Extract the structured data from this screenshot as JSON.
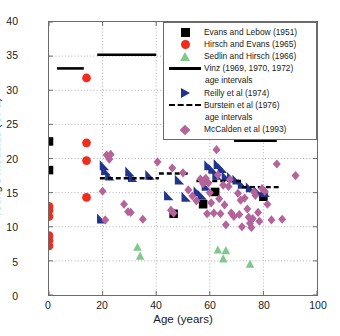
{
  "chart_data": {
    "type": "scatter",
    "title": "",
    "xlabel": "Age (years)",
    "ylabel": "Young's modulus (GPa)",
    "xlim": [
      0,
      100
    ],
    "ylim": [
      0,
      40
    ],
    "xticks": [
      0,
      20,
      40,
      60,
      80,
      100
    ],
    "yticks": [
      0,
      5,
      10,
      15,
      20,
      25,
      30,
      35,
      40
    ],
    "grid": "dotted",
    "legend_position": "top-right",
    "series": [
      {
        "name": "Evans and Lebow (1951)",
        "marker": "square",
        "color": "#000000",
        "points": [
          [
            0.0,
            22.5
          ],
          [
            0.0,
            18.3
          ],
          [
            46.5,
            11.9
          ],
          [
            57.5,
            13.3
          ],
          [
            62.0,
            15.1
          ],
          [
            80.0,
            14.4
          ]
        ]
      },
      {
        "name": "Hirsch and Evans (1965)",
        "marker": "circle",
        "color": "#f42b1c",
        "points": [
          [
            0.0,
            13.0
          ],
          [
            0.0,
            12.4
          ],
          [
            0.0,
            11.5
          ],
          [
            0.0,
            8.7
          ],
          [
            0.0,
            8.0
          ],
          [
            0.0,
            7.2
          ],
          [
            14.0,
            31.8
          ],
          [
            14.0,
            22.3
          ],
          [
            14.0,
            19.7
          ],
          [
            14.0,
            14.3
          ]
        ]
      },
      {
        "name": "Sedlin and Hirsch (1966)",
        "marker": "triangle-up",
        "color": "#7ec98b",
        "points": [
          [
            33.0,
            7.0
          ],
          [
            34.0,
            5.7
          ],
          [
            63.0,
            6.6
          ],
          [
            66.0,
            6.5
          ],
          [
            65.0,
            5.3
          ],
          [
            75.0,
            4.5
          ]
        ]
      },
      {
        "name": "Vinz (1969, 1970, 1972) age intervals",
        "marker": "solid-line",
        "color": "#000000",
        "segments": [
          {
            "x0": 3.0,
            "x1": 13.0,
            "y": 33.2
          },
          {
            "x0": 18.0,
            "x1": 40.0,
            "y": 35.2
          },
          {
            "x0": 69.0,
            "x1": 85.0,
            "y": 22.6
          }
        ]
      },
      {
        "name": "Reilly et al (1974)",
        "marker": "triangle-right",
        "color": "#21358c",
        "points": [
          [
            19.5,
            11.2
          ],
          [
            20.5,
            19.0
          ],
          [
            21.0,
            18.3
          ],
          [
            22.5,
            17.5
          ],
          [
            30.0,
            18.1
          ],
          [
            31.0,
            17.3
          ],
          [
            37.5,
            17.6
          ],
          [
            44.5,
            14.6
          ],
          [
            48.5,
            16.9
          ],
          [
            51.0,
            14.4
          ],
          [
            55.5,
            15.2
          ],
          [
            57.0,
            14.7
          ],
          [
            58.5,
            16.0
          ],
          [
            59.5,
            19.0
          ],
          [
            61.0,
            18.5
          ],
          [
            62.5,
            17.6
          ],
          [
            63.0,
            19.2
          ],
          [
            64.5,
            18.6
          ],
          [
            66.0,
            17.4
          ],
          [
            68.0,
            17.3
          ],
          [
            70.0,
            16.9
          ],
          [
            72.0,
            16.3
          ],
          [
            75.0,
            15.8
          ],
          [
            78.0,
            15.2
          ],
          [
            80.5,
            15.1
          ]
        ]
      },
      {
        "name": "Burstein et al (1976) age intervals",
        "marker": "dashed-line",
        "color": "#000000",
        "segments": [
          {
            "x0": 19.0,
            "x1": 41.0,
            "y": 17.1
          },
          {
            "x0": 41.0,
            "x1": 52.0,
            "y": 17.8
          },
          {
            "x0": 55.0,
            "x1": 72.0,
            "y": 16.7
          },
          {
            "x0": 72.0,
            "x1": 86.0,
            "y": 15.8
          }
        ]
      },
      {
        "name": "McCalden et al (1993)",
        "marker": "diamond",
        "color": "#b4649a",
        "points": [
          [
            21.5,
            20.5
          ],
          [
            23.0,
            20.6
          ],
          [
            22.5,
            19.9
          ],
          [
            20.0,
            15.2
          ],
          [
            21.0,
            11.0
          ],
          [
            28.0,
            13.3
          ],
          [
            29.5,
            12.2
          ],
          [
            30.5,
            12.1
          ],
          [
            35.0,
            11.1
          ],
          [
            40.5,
            19.5
          ],
          [
            46.0,
            18.6
          ],
          [
            45.5,
            12.4
          ],
          [
            46.5,
            12.0
          ],
          [
            50.0,
            17.9
          ],
          [
            52.0,
            15.4
          ],
          [
            53.5,
            14.5
          ],
          [
            55.0,
            13.8
          ],
          [
            56.5,
            17.0
          ],
          [
            57.5,
            16.3
          ],
          [
            58.5,
            17.1
          ],
          [
            59.5,
            16.4
          ],
          [
            60.0,
            15.0
          ],
          [
            60.5,
            13.5
          ],
          [
            61.5,
            12.0
          ],
          [
            62.5,
            21.3
          ],
          [
            63.0,
            17.6
          ],
          [
            63.5,
            14.1
          ],
          [
            64.0,
            11.9
          ],
          [
            65.0,
            16.1
          ],
          [
            65.5,
            13.2
          ],
          [
            66.0,
            10.3
          ],
          [
            67.0,
            15.9
          ],
          [
            68.0,
            12.0
          ],
          [
            69.0,
            11.5
          ],
          [
            70.5,
            14.9
          ],
          [
            71.0,
            11.8
          ],
          [
            72.0,
            10.0
          ],
          [
            73.0,
            14.2
          ],
          [
            74.0,
            12.6
          ],
          [
            74.5,
            11.4
          ],
          [
            75.0,
            10.5
          ],
          [
            75.5,
            9.9
          ],
          [
            76.0,
            11.2
          ],
          [
            77.0,
            14.6
          ],
          [
            78.0,
            12.1
          ],
          [
            78.5,
            10.8
          ],
          [
            79.5,
            15.6
          ],
          [
            80.5,
            15.2
          ],
          [
            81.5,
            13.3
          ],
          [
            83.0,
            11.0
          ],
          [
            85.0,
            19.2
          ],
          [
            87.0,
            11.1
          ],
          [
            92.0,
            17.5
          ],
          [
            59.0,
            11.9
          ],
          [
            67.5,
            16.9
          ],
          [
            71.5,
            13.9
          ],
          [
            76.5,
            15.1
          ]
        ]
      }
    ]
  },
  "legend": {
    "entries": [
      {
        "label": "Evans and Lebow (1951)",
        "key": "square"
      },
      {
        "label": "Hirsch and Evans (1965)",
        "key": "circle"
      },
      {
        "label": "Sedlin and Hirsch (1966)",
        "key": "triangle-up"
      },
      {
        "label": "Vinz (1969, 1970, 1972)",
        "key": "solid-line"
      },
      {
        "label": "age intervals",
        "key": "continuation"
      },
      {
        "label": "Reilly et al (1974)",
        "key": "triangle-right"
      },
      {
        "label": "Burstein et al (1976)",
        "key": "dashed-line"
      },
      {
        "label": "age intervals",
        "key": "continuation"
      },
      {
        "label": "McCalden et al (1993)",
        "key": "diamond"
      }
    ]
  },
  "axes": {
    "ylabel": "Young's modulus (GPa)",
    "xlabel": "Age (years)",
    "yticks": [
      "0",
      "5",
      "10",
      "15",
      "20",
      "25",
      "30",
      "35",
      "40"
    ],
    "xticks": [
      "0",
      "20",
      "40",
      "60",
      "80",
      "100"
    ]
  },
  "colors": {
    "evans": "#000000",
    "hirsch": "#f42b1c",
    "sedlin": "#7ec98b",
    "reilly": "#21358c",
    "mccalden": "#b4649a",
    "grid": "#9a9a9a",
    "frame": "#6b6b6b"
  }
}
